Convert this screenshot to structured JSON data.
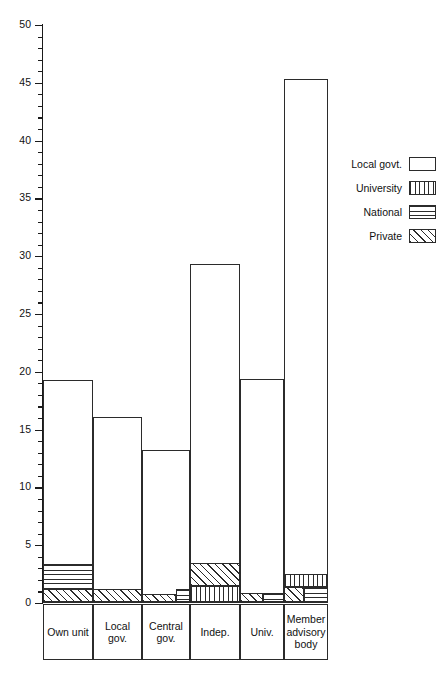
{
  "chart_data": {
    "type": "bar",
    "subtype": "stacked",
    "title": "",
    "xlabel": "",
    "ylabel": "",
    "ylim": [
      0,
      50
    ],
    "ytick_step": 5,
    "yminor_step": 1,
    "grid": false,
    "legend_position": "right",
    "categories": [
      "Own\nunit",
      "Local\ngov.",
      "Central\ngov.",
      "Indep.",
      "Univ.",
      "Member\nadvisory\nbody"
    ],
    "category_labels": [
      "Own unit",
      "Local gov.",
      "Central gov.",
      "Indep.",
      "Univ.",
      "Member advisory body"
    ],
    "ytick_labels": [
      "0",
      "5",
      "10",
      "15",
      "20",
      "25",
      "30",
      "35",
      "40",
      "45",
      "50"
    ],
    "series": [
      {
        "name": "Local govt.",
        "pattern": "plain",
        "values": [
          16.0,
          15.0,
          12.1,
          25.9,
          17.8,
          41.6
        ]
      },
      {
        "name": "University",
        "pattern": "university",
        "values": [
          0.0,
          0.0,
          0.0,
          1.4,
          0.0,
          1.1
        ]
      },
      {
        "name": "National",
        "pattern": "national",
        "values": [
          2.2,
          0.0,
          0.4,
          0.0,
          0.8,
          1.3
        ]
      },
      {
        "name": "Private",
        "pattern": "private",
        "values": [
          1.1,
          1.1,
          0.7,
          2.0,
          0.8,
          1.3
        ]
      }
    ],
    "totals": [
      19.3,
      16.1,
      13.2,
      29.3,
      19.4,
      45.3
    ]
  },
  "legend": {
    "items": [
      {
        "label": "Local govt.",
        "pattern": "plain"
      },
      {
        "label": "University",
        "pattern": "university"
      },
      {
        "label": "National",
        "pattern": "national"
      },
      {
        "label": "Private",
        "pattern": "private"
      }
    ]
  }
}
